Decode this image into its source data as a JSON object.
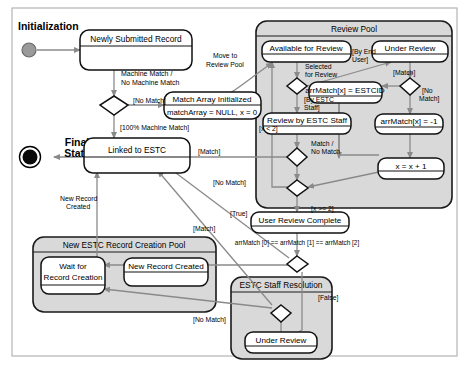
{
  "diagram": {
    "type": "uml-state-machine",
    "title_visible": false,
    "background": "#ffffff",
    "frame_border": "#b0b0b0",
    "composite_fill": "#d9d9d9",
    "state_fill": "#ffffff",
    "line_color": "#808080",
    "text_color": "#000000"
  },
  "annotations": {
    "initialization": "Initialization",
    "final_state_line1": "Final",
    "final_state_line2": "State"
  },
  "states": {
    "newly_submitted_record": "Newly Submitted Record",
    "match_array_initialized_title": "Match Array Initialized",
    "match_array_initialized_body": "matchArray = NULL, x = 0",
    "linked_to_estc": "Linked to ESTC",
    "available_for_review": "Available for Review",
    "under_review": "Under Review",
    "arr_match_estcid": "arrMatch[x] = ESTCID",
    "arr_match_minus_one": "arrMatch[x] = -1",
    "review_by_estc_staff": "Review by ESTC Staff",
    "x_increment": "x = x + 1",
    "user_review_complete": "User Review Complete",
    "wait_for_record_creation_line1": "Wait for",
    "wait_for_record_creation_line2": "Record Creation",
    "new_record_created_state": "New Record Created",
    "estc_under_review": "Under Review"
  },
  "composites": {
    "review_pool": "Review Pool",
    "new_estc_record_creation_pool": "New ESTC Record Creation Pool",
    "estc_staff_resolution": "ESTC Staff Resolution"
  },
  "transitions": {
    "machine_match_line1": "Machine Match /",
    "machine_match_line2": "No Machine Match",
    "no_match_top": "[No Match]",
    "hundred_percent_machine_match": "[100% Machine Match]",
    "move_to_line1": "Move to",
    "move_to_line2": "Review Pool",
    "selected_for_review_line1": "Selected",
    "selected_for_review_line2": "for Review",
    "by_end_user_line1": "[By End",
    "by_end_user_line2": "User]",
    "by_estc_staff_line1": "[By ESTC",
    "by_estc_staff_line2": "Staff]",
    "match_upper_right": "[Match]",
    "no_match_right_line1": "[No",
    "no_match_right_line2": "Match]",
    "match_no_match_line1": "Match /",
    "match_no_match_line2": "No Match",
    "x_less_than_two": "[x < 2]",
    "x_gte_two": "[x >= 2]",
    "match_to_linked": "[Match]",
    "no_match_mid": "[No Match]",
    "new_record_created_line1": "New Record",
    "new_record_created_line2": "Created",
    "true_label": "[True]",
    "match_to_pool": "[Match]",
    "arr_match_equality": "arrMatch [0] == arrMatch [1] == arrMatch [2]",
    "false_label": "[False]",
    "no_match_bottom": "[No Match]"
  }
}
